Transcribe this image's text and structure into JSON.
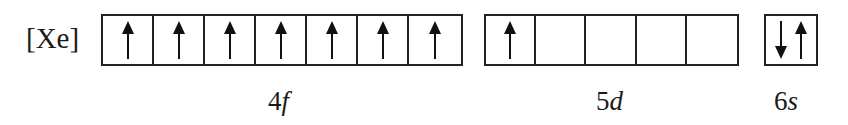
{
  "core": "[Xe]",
  "subshells": [
    {
      "name": "4f",
      "label_number": "4",
      "label_letter": "f",
      "orbitals": [
        [
          "up"
        ],
        [
          "up"
        ],
        [
          "up"
        ],
        [
          "up"
        ],
        [
          "up"
        ],
        [
          "up"
        ],
        [
          "up"
        ]
      ]
    },
    {
      "name": "5d",
      "label_number": "5",
      "label_letter": "d",
      "orbitals": [
        [
          "up"
        ],
        [],
        [],
        [],
        []
      ]
    },
    {
      "name": "6s",
      "label_number": "6",
      "label_letter": "s",
      "orbitals": [
        [
          "down",
          "up"
        ]
      ]
    }
  ],
  "icons": {
    "up": "up-arrow-icon (spin up electron)",
    "down": "down-arrow-icon (spin down electron)"
  },
  "colors": {
    "line": "#222222",
    "background": "#ffffff"
  }
}
